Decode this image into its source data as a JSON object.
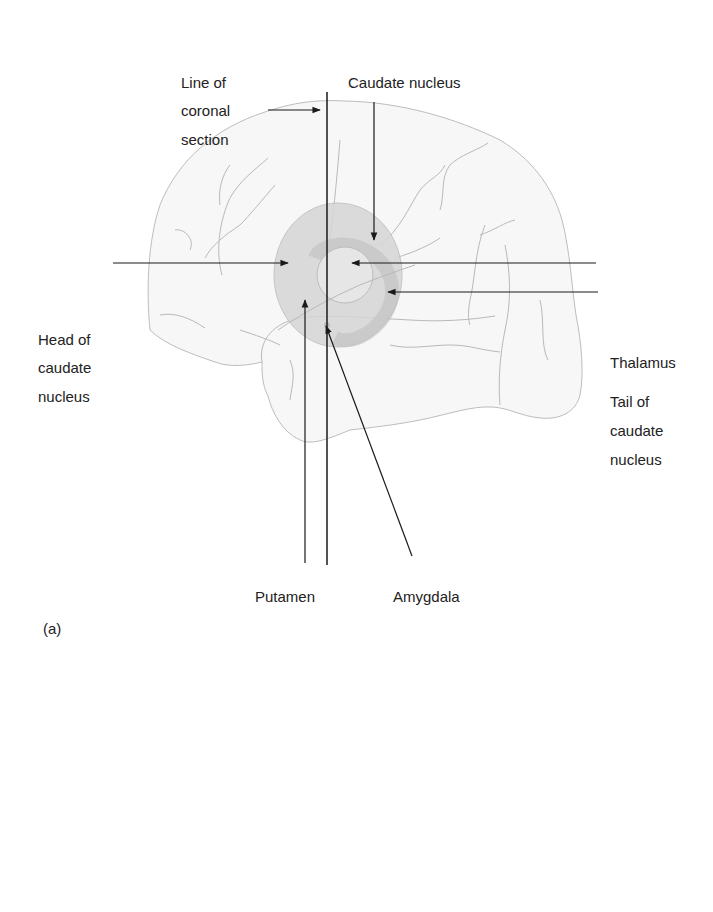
{
  "figure_a": {
    "panel_label": "(a)",
    "title_lines": [],
    "labels": {
      "line_of_coronal_section": [
        "Line of",
        "coronal",
        "section"
      ],
      "caudate_nucleus": "Caudate nucleus",
      "head_of_caudate_nucleus": [
        "Head of",
        "caudate",
        "nucleus"
      ],
      "thalamus": "Thalamus",
      "tail_of_caudate_nucleus": [
        "Tail of",
        "caudate",
        "nucleus"
      ],
      "putamen": "Putamen",
      "amygdala": "Amygdala"
    }
  },
  "figure_b": {
    "panel_label": "(b)",
    "labels": {
      "caudate_nucleus": "Caudate nucleus",
      "claustrum": "Claustrum",
      "putamen": "Putamen",
      "globus_pallidus": "Globus pallidus",
      "subthalamic_nucleus": "Subthalamic nucleus",
      "substantia_nigra": "Substantia nigra",
      "crus_cerebri": "Crus cerebri",
      "vl": "VL",
      "md": "MD",
      "vpl": "VPL"
    }
  },
  "colors": {
    "grey_matter": "#dcdcdc",
    "white_matter": "#f3f3f3",
    "nucleus": "#cfcfcf",
    "outline": "#bdbdbd",
    "text": "#222222",
    "arrow": "#1a1a1a"
  }
}
